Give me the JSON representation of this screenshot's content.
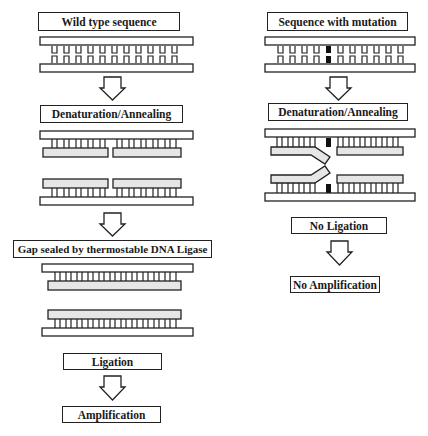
{
  "left_column": {
    "title": "Wild type sequence",
    "step1": "Denaturation/Annealing",
    "step2": "Gap sealed by  thermostable DNA Ligase",
    "step3": "Ligation",
    "step4": "Amplification"
  },
  "right_column": {
    "title": "Sequence with mutation",
    "step1": "Denaturation/Annealing",
    "step2": "No Ligation",
    "step3": "No Amplification"
  },
  "colors": {
    "outline": "#222222",
    "probe_fill": "#e6e6e6",
    "mutation": "#111111"
  }
}
